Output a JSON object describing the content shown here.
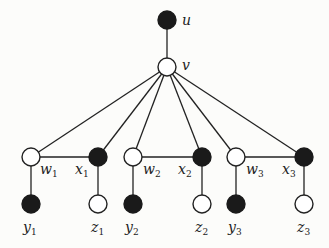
{
  "diagram": {
    "type": "graph",
    "nodes": [
      {
        "id": "u",
        "label": "u",
        "sub": "",
        "filled": true,
        "x": 167,
        "y": 20,
        "lx": 182,
        "ly": 25
      },
      {
        "id": "v",
        "label": "v",
        "sub": "",
        "filled": false,
        "x": 167,
        "y": 67,
        "lx": 182,
        "ly": 70
      },
      {
        "id": "w1",
        "label": "w",
        "sub": "1",
        "filled": false,
        "x": 31,
        "y": 157,
        "lx": 40,
        "ly": 174
      },
      {
        "id": "x1",
        "label": "x",
        "sub": "1",
        "filled": true,
        "x": 98,
        "y": 157,
        "lx": 75,
        "ly": 174
      },
      {
        "id": "w2",
        "label": "w",
        "sub": "2",
        "filled": false,
        "x": 133,
        "y": 157,
        "lx": 143,
        "ly": 174
      },
      {
        "id": "x2",
        "label": "x",
        "sub": "2",
        "filled": true,
        "x": 202,
        "y": 157,
        "lx": 178,
        "ly": 174
      },
      {
        "id": "w3",
        "label": "w",
        "sub": "3",
        "filled": false,
        "x": 236,
        "y": 157,
        "lx": 246,
        "ly": 174
      },
      {
        "id": "x3",
        "label": "x",
        "sub": "3",
        "filled": true,
        "x": 304,
        "y": 157,
        "lx": 282,
        "ly": 174
      },
      {
        "id": "y1",
        "label": "y",
        "sub": "1",
        "filled": true,
        "x": 31,
        "y": 204,
        "lx": 23,
        "ly": 232
      },
      {
        "id": "z1",
        "label": "z",
        "sub": "1",
        "filled": false,
        "x": 98,
        "y": 204,
        "lx": 91,
        "ly": 232
      },
      {
        "id": "y2",
        "label": "y",
        "sub": "2",
        "filled": true,
        "x": 133,
        "y": 204,
        "lx": 125,
        "ly": 232
      },
      {
        "id": "z2",
        "label": "z",
        "sub": "2",
        "filled": false,
        "x": 202,
        "y": 204,
        "lx": 195,
        "ly": 232
      },
      {
        "id": "y3",
        "label": "y",
        "sub": "3",
        "filled": true,
        "x": 236,
        "y": 204,
        "lx": 228,
        "ly": 232
      },
      {
        "id": "z3",
        "label": "z",
        "sub": "3",
        "filled": false,
        "x": 304,
        "y": 204,
        "lx": 297,
        "ly": 232
      }
    ],
    "edges": [
      [
        "u",
        "v"
      ],
      [
        "v",
        "w1"
      ],
      [
        "v",
        "x1"
      ],
      [
        "v",
        "w2"
      ],
      [
        "v",
        "x2"
      ],
      [
        "v",
        "w3"
      ],
      [
        "v",
        "x3"
      ],
      [
        "w1",
        "x1"
      ],
      [
        "w2",
        "x2"
      ],
      [
        "w3",
        "x3"
      ],
      [
        "w1",
        "y1"
      ],
      [
        "x1",
        "z1"
      ],
      [
        "w2",
        "y2"
      ],
      [
        "x2",
        "z2"
      ],
      [
        "w3",
        "y3"
      ],
      [
        "x3",
        "z3"
      ]
    ],
    "node_radius": 9,
    "colors": {
      "filled": "#1a1a1a",
      "open": "#ffffff",
      "stroke": "#222222",
      "background": "#fcfcfa"
    }
  }
}
